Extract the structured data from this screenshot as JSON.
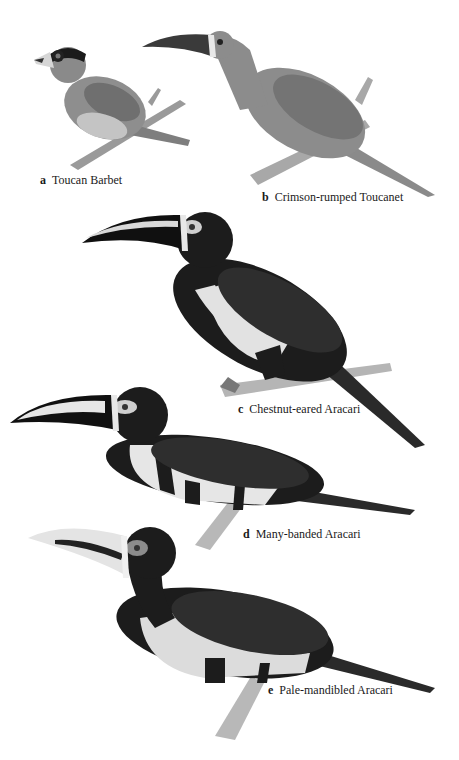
{
  "plate": {
    "background": "#ffffff",
    "birds": [
      {
        "letter": "a",
        "name": "Toucan Barbet",
        "tone": "#8a8a8a",
        "head": "#1b1b1b"
      },
      {
        "letter": "b",
        "name": "Crimson-rumped Toucanet",
        "tone": "#8c8c8c",
        "head": "#8c8c8c"
      },
      {
        "letter": "c",
        "name": "Chestnut-eared Aracari",
        "tone": "#1c1c1c",
        "belly": "#e2e2e2"
      },
      {
        "letter": "d",
        "name": "Many-banded Aracari",
        "tone": "#1c1c1c",
        "belly": "#e6e6e6"
      },
      {
        "letter": "e",
        "name": "Pale-mandibled Aracari",
        "tone": "#1c1c1c",
        "belly": "#dcdcdc"
      }
    ]
  }
}
